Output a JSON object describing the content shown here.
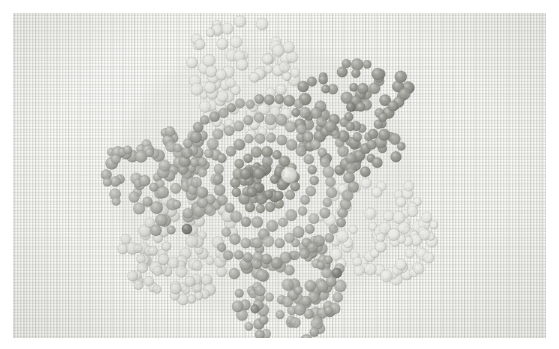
{
  "image": {
    "title": "Beaded flower motif on woven linen",
    "subject": "hand-beaded five-petal flower with concentric spiral centre",
    "medium": "seed beads stitched on plain-weave linen fabric",
    "width": 559,
    "height": 349,
    "frame_margin": 13,
    "palette": {
      "paper_white": "#ffffff",
      "fabric_base": "#f3f3f1",
      "fabric_highlight": "#fbfbfa",
      "fabric_shadow": "#e3e3df",
      "bead_darkest": "#8d8d8a",
      "bead_dark": "#9e9e9b",
      "bead_mid": "#b4b4b0",
      "bead_light": "#cfcfcb",
      "bead_palest": "#e4e4e0",
      "bead_outline": "#7c7c79"
    }
  },
  "canvas": {
    "width": 533,
    "height": 325,
    "center_x": 252,
    "center_y": 168
  },
  "motif": {
    "name": "five-petal beaded flower",
    "petal_count": 5,
    "bead_shape": "round seed bead",
    "bead_radius_px": 5.1,
    "petals": [
      {
        "name": "petal-top-left",
        "angle_deg": -102,
        "distance": 104,
        "rx": 64,
        "ry": 56,
        "rotate_deg": -14,
        "tone": "bead_palest",
        "tone_hex": "#e2e2de",
        "opacity": 0.78,
        "bead_count": 86,
        "seed": 11
      },
      {
        "name": "petal-top-right",
        "angle_deg": -36,
        "distance": 112,
        "rx": 62,
        "ry": 58,
        "rotate_deg": 22,
        "tone": "bead_darkest",
        "tone_hex": "#95958f",
        "opacity": 0.94,
        "bead_count": 94,
        "seed": 27
      },
      {
        "name": "petal-right",
        "angle_deg": 22,
        "distance": 122,
        "rx": 60,
        "ry": 52,
        "rotate_deg": 8,
        "tone": "bead_palest",
        "tone_hex": "#e6e6e2",
        "opacity": 0.72,
        "bead_count": 88,
        "seed": 43
      },
      {
        "name": "petal-bottom-right",
        "angle_deg": 78,
        "distance": 108,
        "rx": 58,
        "ry": 56,
        "rotate_deg": -8,
        "tone": "bead_dark",
        "tone_hex": "#a6a6a1",
        "opacity": 0.9,
        "bead_count": 90,
        "seed": 59
      },
      {
        "name": "petal-bottom-left",
        "angle_deg": 142,
        "distance": 106,
        "rx": 60,
        "ry": 54,
        "rotate_deg": 16,
        "tone": "bead_light",
        "tone_hex": "#d8d8d4",
        "opacity": 0.76,
        "bead_count": 84,
        "seed": 71
      }
    ],
    "left_lobe": {
      "name": "petal-left",
      "angle_deg": 182,
      "distance": 100,
      "rx": 62,
      "ry": 54,
      "rotate_deg": -6,
      "tone": "bead_mid",
      "tone_hex": "#aaaaa5",
      "opacity": 0.92,
      "bead_count": 96,
      "seed": 97
    },
    "rings": [
      {
        "name": "ring-outer",
        "radius": 86,
        "bead_count": 46,
        "tone_hex": "#9b9b96",
        "opacity": 0.86,
        "arc_start_deg": 188,
        "arc_sweep_deg": 300,
        "jitter": 3.4,
        "seed": 5
      },
      {
        "name": "ring-third",
        "radius": 66,
        "bead_count": 36,
        "tone_hex": "#a8a8a3",
        "opacity": 0.84,
        "arc_start_deg": 150,
        "arc_sweep_deg": 345,
        "jitter": 3.0,
        "seed": 13
      },
      {
        "name": "ring-second",
        "radius": 47,
        "bead_count": 26,
        "tone_hex": "#a0a09b",
        "opacity": 0.88,
        "arc_start_deg": 100,
        "arc_sweep_deg": 355,
        "jitter": 2.6,
        "seed": 23
      },
      {
        "name": "ring-inner",
        "radius": 30,
        "bead_count": 18,
        "tone_hex": "#97978f",
        "opacity": 0.92,
        "arc_start_deg": 60,
        "arc_sweep_deg": 350,
        "jitter": 2.2,
        "seed": 37
      }
    ],
    "core": {
      "name": "flower-core",
      "radius": 22,
      "bead_count": 42,
      "tone_hex": "#8d8d86",
      "opacity": 0.95,
      "seed": 101,
      "highlight": {
        "cx": 24,
        "cy": -6,
        "r": 8,
        "hex": "#e7e7e3",
        "opacity": 0.8
      }
    },
    "accent_beads": [
      {
        "name": "accent-bead-left",
        "x": -78,
        "y": 48,
        "r": 5.2,
        "hex": "#6f6f6c",
        "opacity": 0.92
      },
      {
        "name": "accent-bead-lower-right",
        "x": 72,
        "y": 92,
        "r": 5.0,
        "hex": "#74746f",
        "opacity": 0.9
      },
      {
        "name": "accent-bead-upper-right",
        "x": 86,
        "y": -74,
        "r": 4.8,
        "hex": "#787873",
        "opacity": 0.88
      },
      {
        "name": "accent-bead-bottom",
        "x": -10,
        "y": 128,
        "r": 4.4,
        "hex": "#7d7d78",
        "opacity": 0.86
      }
    ],
    "shadow_halo": {
      "name": "motif-shadow",
      "rx": 150,
      "ry": 138,
      "hex": "#d4d4cf",
      "opacity": 0.38
    }
  }
}
